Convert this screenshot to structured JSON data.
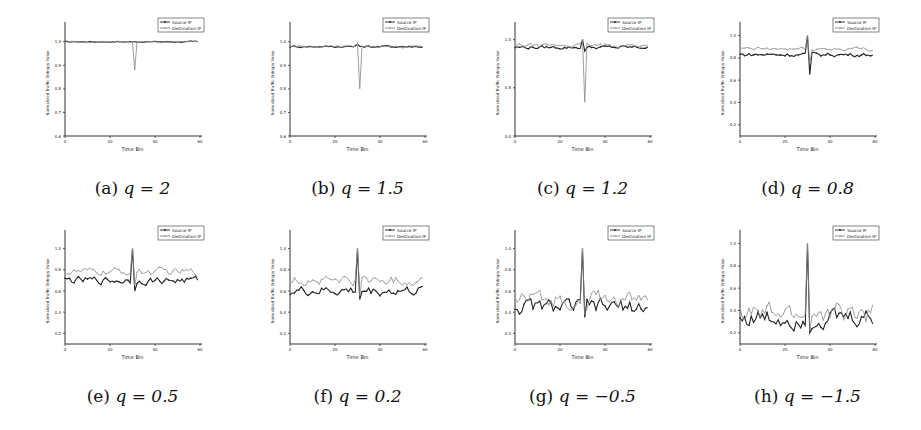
{
  "figure": {
    "panels": [
      {
        "label": "(a)",
        "qtext": "q = 2"
      },
      {
        "label": "(b)",
        "qtext": "q = 1.5"
      },
      {
        "label": "(c)",
        "qtext": "q = 1.2"
      },
      {
        "label": "(d)",
        "qtext": "q = 0.8"
      },
      {
        "label": "(e)",
        "qtext": "q = 0.5"
      },
      {
        "label": "(f)",
        "qtext": "q = 0.2"
      },
      {
        "label": "(g)",
        "qtext": "q = −0.5"
      },
      {
        "label": "(h)",
        "qtext": "q = −1.5"
      }
    ]
  },
  "chart_data": [
    {
      "type": "line",
      "id": "a",
      "caption": "(a) q = 2",
      "xlabel": "Time Bin",
      "ylabel": "Normalized Traffic Entropy Value",
      "xlim": [
        0,
        60
      ],
      "xticks": [
        0,
        20,
        40,
        60
      ],
      "ylim": [
        0.6,
        1.05
      ],
      "yticks": [
        0.6,
        0.7,
        0.8,
        0.9,
        1.0
      ],
      "legend": [
        "Source IP",
        "Destination IP"
      ],
      "legend_position": "upper right",
      "series": [
        {
          "name": "Source IP",
          "baseline": 1.0,
          "noise": 0.002,
          "spike_at": 30,
          "spike_value": 1.0,
          "dip_value": 1.0
        },
        {
          "name": "Destination IP",
          "baseline": 1.0,
          "noise": 0.002,
          "spike_at": 30,
          "spike_value": 1.0,
          "dip_value": 0.88
        }
      ]
    },
    {
      "type": "line",
      "id": "b",
      "caption": "(b) q = 1.5",
      "xlabel": "Time Bin",
      "ylabel": "Normalized Traffic Entropy Value",
      "xlim": [
        0,
        60
      ],
      "xticks": [
        0,
        20,
        40,
        60
      ],
      "ylim": [
        0.6,
        1.05
      ],
      "yticks": [
        0.6,
        0.7,
        0.8,
        0.9,
        1.0
      ],
      "legend": [
        "Source IP",
        "Destination IP"
      ],
      "legend_position": "upper right",
      "series": [
        {
          "name": "Source IP",
          "baseline": 0.98,
          "noise": 0.004,
          "spike_at": 30,
          "spike_value": 0.99,
          "dip_value": 0.98
        },
        {
          "name": "Destination IP",
          "baseline": 0.98,
          "noise": 0.004,
          "spike_at": 30,
          "spike_value": 0.99,
          "dip_value": 0.8
        }
      ]
    },
    {
      "type": "line",
      "id": "c",
      "caption": "(c) q = 1.2",
      "xlabel": "Time Bin",
      "ylabel": "Normalized Traffic Entropy Value",
      "xlim": [
        0,
        60
      ],
      "xticks": [
        0,
        20,
        40,
        60
      ],
      "ylim": [
        0.0,
        1.1
      ],
      "yticks": [
        0.0,
        0.5,
        1.0
      ],
      "legend": [
        "Source IP",
        "Destination IP"
      ],
      "legend_position": "upper right",
      "series": [
        {
          "name": "Source IP",
          "baseline": 0.92,
          "noise": 0.015,
          "spike_at": 30,
          "spike_value": 1.0,
          "dip_value": 0.88
        },
        {
          "name": "Destination IP",
          "baseline": 0.94,
          "noise": 0.015,
          "spike_at": 30,
          "spike_value": 1.0,
          "dip_value": 0.35
        }
      ]
    },
    {
      "type": "line",
      "id": "d",
      "caption": "(d) q = 0.8",
      "xlabel": "Time Bin",
      "ylabel": "Normalized Traffic Entropy Value",
      "xlim": [
        0,
        60
      ],
      "xticks": [
        0,
        20,
        40,
        60
      ],
      "ylim": [
        0.1,
        1.05
      ],
      "yticks": [
        0.2,
        0.4,
        0.6,
        0.8,
        1.0
      ],
      "legend": [
        "Source IP",
        "Destination IP"
      ],
      "legend_position": "upper right",
      "series": [
        {
          "name": "Source IP",
          "baseline": 0.83,
          "noise": 0.015,
          "spike_at": 30,
          "spike_value": 1.0,
          "dip_value": 0.65
        },
        {
          "name": "Destination IP",
          "baseline": 0.88,
          "noise": 0.015,
          "spike_at": 30,
          "spike_value": 1.0,
          "dip_value": 0.75
        }
      ]
    },
    {
      "type": "line",
      "id": "e",
      "caption": "(e) q = 0.5",
      "xlabel": "Time Bin",
      "ylabel": "Normalized Traffic Entropy Value",
      "xlim": [
        0,
        60
      ],
      "xticks": [
        0,
        20,
        40,
        60
      ],
      "ylim": [
        0.1,
        1.1
      ],
      "yticks": [
        0.2,
        0.4,
        0.6,
        0.8,
        1.0
      ],
      "legend": [
        "Source IP",
        "Destination IP"
      ],
      "legend_position": "upper right",
      "series": [
        {
          "name": "Source IP",
          "baseline": 0.7,
          "noise": 0.03,
          "spike_at": 30,
          "spike_value": 1.0,
          "dip_value": 0.6
        },
        {
          "name": "Destination IP",
          "baseline": 0.78,
          "noise": 0.03,
          "spike_at": 30,
          "spike_value": 1.0,
          "dip_value": 0.65
        }
      ]
    },
    {
      "type": "line",
      "id": "f",
      "caption": "(f) q = 0.2",
      "xlabel": "Time Bin",
      "ylabel": "Normalized Traffic Entropy Value",
      "xlim": [
        0,
        60
      ],
      "xticks": [
        0,
        20,
        40,
        60
      ],
      "ylim": [
        0.1,
        1.1
      ],
      "yticks": [
        0.2,
        0.4,
        0.6,
        0.8,
        1.0
      ],
      "legend": [
        "Source IP",
        "Destination IP"
      ],
      "legend_position": "upper right",
      "series": [
        {
          "name": "Source IP",
          "baseline": 0.6,
          "noise": 0.04,
          "spike_at": 30,
          "spike_value": 1.0,
          "dip_value": 0.52
        },
        {
          "name": "Destination IP",
          "baseline": 0.7,
          "noise": 0.04,
          "spike_at": 30,
          "spike_value": 1.0,
          "dip_value": 0.55
        }
      ]
    },
    {
      "type": "line",
      "id": "g",
      "caption": "(g) q = −0.5",
      "xlabel": "Time Bin",
      "ylabel": "Normalized Traffic Entropy Value",
      "xlim": [
        0,
        60
      ],
      "xticks": [
        0,
        20,
        40,
        60
      ],
      "ylim": [
        0.1,
        1.1
      ],
      "yticks": [
        0.2,
        0.4,
        0.6,
        0.8,
        1.0
      ],
      "legend": [
        "Source IP",
        "Destination IP"
      ],
      "legend_position": "upper right",
      "series": [
        {
          "name": "Source IP",
          "baseline": 0.45,
          "noise": 0.06,
          "spike_at": 30,
          "spike_value": 1.0,
          "dip_value": 0.35
        },
        {
          "name": "Destination IP",
          "baseline": 0.52,
          "noise": 0.07,
          "spike_at": 30,
          "spike_value": 1.0,
          "dip_value": 0.38
        }
      ]
    },
    {
      "type": "line",
      "id": "h",
      "caption": "(h) q = −1.5",
      "xlabel": "Time Bin",
      "ylabel": "Normalized Traffic Entropy Value",
      "xlim": [
        0,
        60
      ],
      "xticks": [
        0,
        20,
        40,
        60
      ],
      "ylim": [
        0.1,
        1.05
      ],
      "yticks": [
        0.2,
        0.4,
        0.6,
        0.8,
        1.0
      ],
      "legend": [
        "Source IP",
        "Destination IP"
      ],
      "legend_position": "upper right",
      "series": [
        {
          "name": "Source IP",
          "baseline": 0.33,
          "noise": 0.07,
          "spike_at": 30,
          "spike_value": 1.0,
          "dip_value": 0.2
        },
        {
          "name": "Destination IP",
          "baseline": 0.37,
          "noise": 0.08,
          "spike_at": 30,
          "spike_value": 1.0,
          "dip_value": 0.22
        }
      ]
    }
  ]
}
